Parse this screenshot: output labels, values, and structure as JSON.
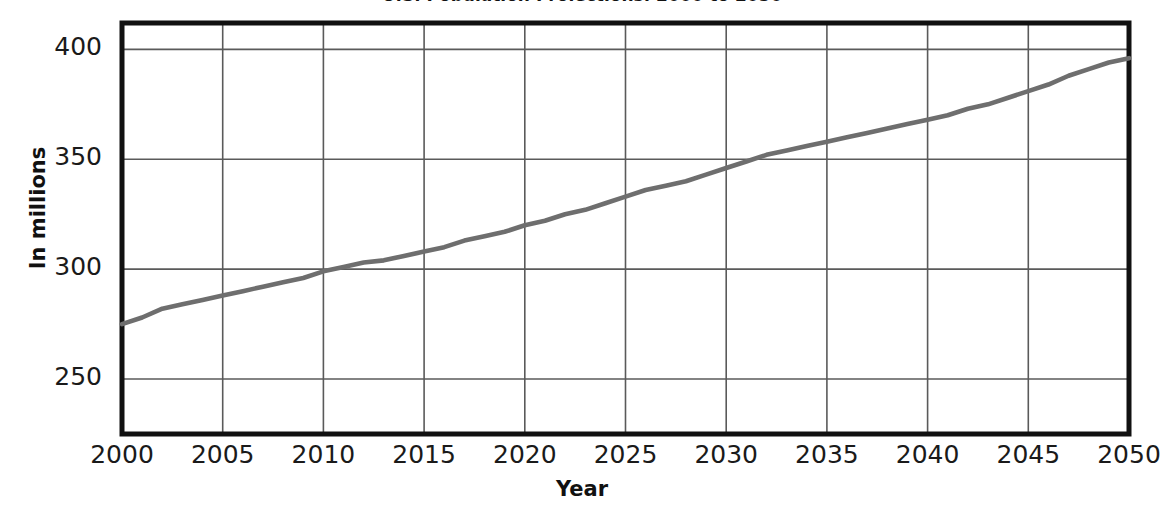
{
  "chart_data": {
    "type": "line",
    "title": "U.S. Population Projections, 2000 to 2050",
    "xlabel": "Year",
    "ylabel": "In millions",
    "xlim": [
      2000,
      2050
    ],
    "ylim": [
      225,
      412
    ],
    "grid": true,
    "legend": "none",
    "line_color": "#6e6e6e",
    "frame_color": "#111111",
    "grid_color": "#5a5a5a",
    "xticks": [
      2000,
      2005,
      2010,
      2015,
      2020,
      2025,
      2030,
      2035,
      2040,
      2045,
      2050
    ],
    "xtick_labels": [
      "2000",
      "2005",
      "2010",
      "2015",
      "2020",
      "2025",
      "2030",
      "2035",
      "2040",
      "2045",
      "2050"
    ],
    "yticks": [
      250,
      300,
      350,
      400
    ],
    "ytick_labels": [
      "250",
      "300",
      "350",
      "400"
    ],
    "series": [
      {
        "name": "U.S. population",
        "x": [
          2000,
          2001,
          2002,
          2003,
          2004,
          2005,
          2006,
          2007,
          2008,
          2009,
          2010,
          2011,
          2012,
          2013,
          2014,
          2015,
          2016,
          2017,
          2018,
          2019,
          2020,
          2021,
          2022,
          2023,
          2024,
          2025,
          2026,
          2027,
          2028,
          2029,
          2030,
          2031,
          2032,
          2033,
          2034,
          2035,
          2036,
          2037,
          2038,
          2039,
          2040,
          2041,
          2042,
          2043,
          2044,
          2045,
          2046,
          2047,
          2048,
          2049,
          2050
        ],
        "values": [
          275,
          278,
          282,
          284,
          286,
          288,
          290,
          292,
          294,
          296,
          299,
          301,
          303,
          304,
          306,
          308,
          310,
          313,
          315,
          317,
          320,
          322,
          325,
          327,
          330,
          333,
          336,
          338,
          340,
          343,
          346,
          349,
          352,
          354,
          356,
          358,
          360,
          362,
          364,
          366,
          368,
          370,
          373,
          375,
          378,
          381,
          384,
          388,
          391,
          394,
          396
        ]
      }
    ]
  }
}
